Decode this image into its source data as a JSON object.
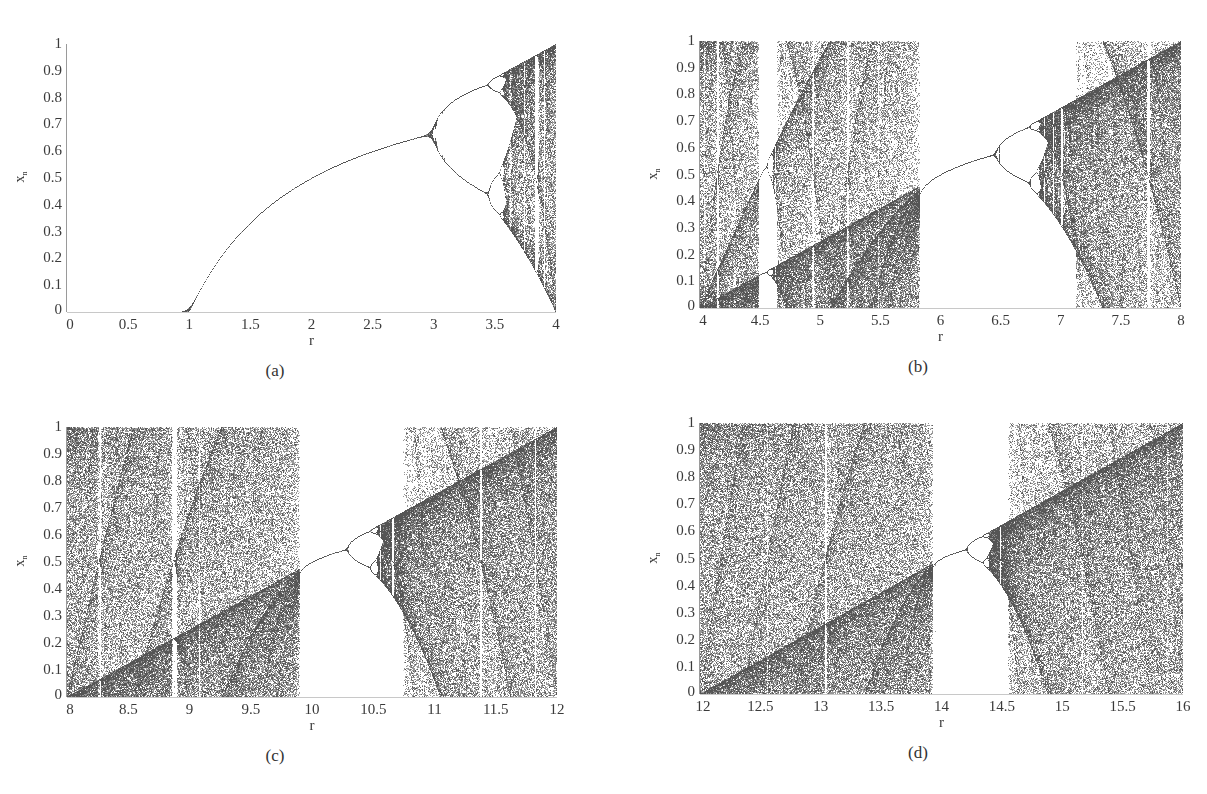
{
  "figure": {
    "panels": [
      {
        "id": "a",
        "caption": "(a)",
        "xlabel": "r",
        "ylabel": "x",
        "ylabel_sub": "n",
        "xticks": [
          "0",
          "0.5",
          "1",
          "1.5",
          "2",
          "2.5",
          "3",
          "3.5",
          "4"
        ],
        "yticks": [
          "0",
          "0.1",
          "0.2",
          "0.3",
          "0.4",
          "0.5",
          "0.6",
          "0.7",
          "0.8",
          "0.9",
          "1"
        ]
      },
      {
        "id": "b",
        "caption": "(b)",
        "xlabel": "r",
        "ylabel": "x",
        "ylabel_sub": "n",
        "xticks": [
          "4",
          "4.5",
          "5",
          "5.5",
          "6",
          "6.5",
          "7",
          "7.5",
          "8"
        ],
        "yticks": [
          "0",
          "0.1",
          "0.2",
          "0.3",
          "0.4",
          "0.5",
          "0.6",
          "0.7",
          "0.8",
          "0.9",
          "1"
        ]
      },
      {
        "id": "c",
        "caption": "(c)",
        "xlabel": "r",
        "ylabel": "x",
        "ylabel_sub": "n",
        "xticks": [
          "8",
          "8.5",
          "9",
          "9.5",
          "10",
          "10.5",
          "11",
          "11.5",
          "12"
        ],
        "yticks": [
          "0",
          "0.1",
          "0.2",
          "0.3",
          "0.4",
          "0.5",
          "0.6",
          "0.7",
          "0.8",
          "0.9",
          "1"
        ]
      },
      {
        "id": "d",
        "caption": "(d)",
        "xlabel": "r",
        "ylabel": "x",
        "ylabel_sub": "n",
        "xticks": [
          "12",
          "12.5",
          "13",
          "13.5",
          "14",
          "14.5",
          "15",
          "15.5",
          "16"
        ],
        "yticks": [
          "0",
          "0.1",
          "0.2",
          "0.3",
          "0.4",
          "0.5",
          "0.6",
          "0.7",
          "0.8",
          "0.9",
          "1"
        ]
      }
    ]
  },
  "chart_data": [
    {
      "type": "scatter",
      "title": "(a)",
      "subtitle": "Bifurcation diagram",
      "xlabel": "r",
      "ylabel": "x_n",
      "xlim": [
        0,
        4
      ],
      "ylim": [
        0,
        1
      ],
      "grid": false,
      "legend": "none",
      "map": "x_{n+1} = r x_n (1 - x_n) mod 1",
      "features": {
        "fixed_point_zero_until": 1,
        "first_bifurcation": 3.0,
        "second_bifurcation": 3.45,
        "chaos_onset": 3.57,
        "period3_window": 3.83,
        "x_at_r3": 0.67
      }
    },
    {
      "type": "scatter",
      "title": "(b)",
      "subtitle": "Bifurcation diagram",
      "xlabel": "r",
      "ylabel": "x_n",
      "xlim": [
        4,
        8
      ],
      "ylim": [
        0,
        1
      ],
      "grid": false,
      "legend": "none",
      "map": "x_{n+1} = r x_n (1 - x_n) mod 1",
      "features": {
        "chaotic_band_1": [
          4.0,
          5.82
        ],
        "periodic_window": [
          5.82,
          6.8
        ],
        "window_bifurcation": 6.48,
        "chaotic_band_2": [
          6.8,
          8.0
        ],
        "white_stripes": [
          4.14,
          4.5,
          4.95,
          5.23,
          7.0,
          7.72
        ],
        "diagonal_line": "x = r/4 - 1"
      }
    },
    {
      "type": "scatter",
      "title": "(c)",
      "subtitle": "Bifurcation diagram",
      "xlabel": "r",
      "ylabel": "x_n",
      "xlim": [
        8,
        12
      ],
      "ylim": [
        0,
        1
      ],
      "grid": false,
      "legend": "none",
      "map": "x_{n+1} = r x_n (1 - x_n) mod 1",
      "features": {
        "chaotic_band_1": [
          8.0,
          9.88
        ],
        "periodic_window": [
          9.88,
          10.55
        ],
        "window_bifurcation": 10.3,
        "chaotic_band_2": [
          10.55,
          12.0
        ],
        "white_stripes": [
          8.26,
          8.88,
          10.68,
          11.38
        ],
        "diagonal_line": "x = r/4 - 2"
      }
    },
    {
      "type": "scatter",
      "title": "(d)",
      "subtitle": "Bifurcation diagram",
      "xlabel": "r",
      "ylabel": "x_n",
      "xlim": [
        12,
        16
      ],
      "ylim": [
        0,
        1
      ],
      "grid": false,
      "legend": "none",
      "map": "x_{n+1} = r x_n (1 - x_n) mod 1",
      "features": {
        "chaotic_band_1": [
          12.0,
          13.92
        ],
        "periodic_window": [
          13.92,
          14.4
        ],
        "window_bifurcation": 14.2,
        "chaotic_band_2": [
          14.4,
          16.0
        ],
        "white_stripes": [
          12.17,
          12.55,
          13.02,
          15.18
        ],
        "diagonal_line": "x = r/4 - 3"
      }
    }
  ]
}
